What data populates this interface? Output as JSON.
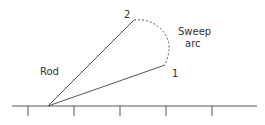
{
  "diagram": {
    "labels": {
      "rod": "Rod",
      "sweep_line1": "Sweep",
      "sweep_line2": "arc",
      "point1": "1",
      "point2": "2"
    },
    "colors": {
      "line": "#555555",
      "text": "#333333",
      "background": "#ffffff"
    },
    "geometry": {
      "pivot": [
        48,
        106
      ],
      "point1": [
        165,
        65
      ],
      "point2": [
        134,
        20
      ],
      "baseline_y": 106,
      "ticks_x": [
        28,
        74,
        120,
        166,
        212
      ]
    }
  }
}
